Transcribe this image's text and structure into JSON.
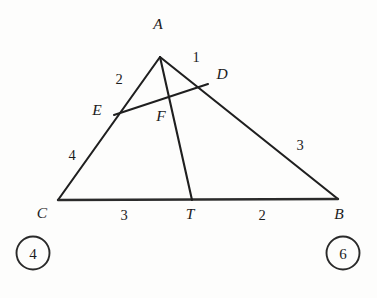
{
  "figure": {
    "background_color": "#fdfdfc",
    "stroke_color": "#1f1f1f",
    "text_color": "#1c1c1c"
  },
  "vertices": [
    {
      "id": "A",
      "label": "A",
      "x": 160,
      "y": 57,
      "label_x": 158,
      "label_y": 29
    },
    {
      "id": "B",
      "label": "B",
      "x": 338,
      "y": 199,
      "label_x": 339,
      "label_y": 219
    },
    {
      "id": "C",
      "label": "C",
      "x": 58,
      "y": 200,
      "label_x": 42,
      "label_y": 218
    },
    {
      "id": "D",
      "label": "D",
      "x": 208,
      "y": 84,
      "label_x": 222,
      "label_y": 79
    },
    {
      "id": "E",
      "label": "E",
      "x": 114,
      "y": 115,
      "label_x": 97,
      "label_y": 115
    },
    {
      "id": "F",
      "label": "F",
      "x": 170,
      "y": 97,
      "label_x": 161,
      "label_y": 121
    },
    {
      "id": "T",
      "label": "T",
      "x": 192,
      "y": 200,
      "label_x": 190,
      "label_y": 219
    }
  ],
  "segments": [
    {
      "id": "CA",
      "from": "C",
      "to": "A",
      "name": "side-c-to-a"
    },
    {
      "id": "AB",
      "from": "A",
      "to": "B",
      "name": "side-a-to-b"
    },
    {
      "id": "CB",
      "from": "C",
      "to": "B",
      "name": "base-c-to-b"
    },
    {
      "id": "AT",
      "from": "A",
      "to": "T",
      "name": "cevian-a-to-t"
    },
    {
      "id": "ED",
      "from": "E",
      "to": "D",
      "name": "transversal-e-to-d"
    }
  ],
  "segment_labels": [
    {
      "id": "AD",
      "value": "1",
      "x": 196,
      "y": 62,
      "name": "length-label-ad"
    },
    {
      "id": "AE",
      "value": "2",
      "x": 119,
      "y": 84,
      "name": "length-label-ae"
    },
    {
      "id": "EC",
      "value": "4",
      "x": 72,
      "y": 160,
      "name": "length-label-ec"
    },
    {
      "id": "DB",
      "value": "3",
      "x": 300,
      "y": 150,
      "name": "length-label-db"
    },
    {
      "id": "CT",
      "value": "3",
      "x": 124,
      "y": 220,
      "name": "length-label-ct"
    },
    {
      "id": "TB",
      "value": "2",
      "x": 262,
      "y": 220,
      "name": "length-label-tb"
    }
  ],
  "answer_circles": [
    {
      "id": "left",
      "value": "4",
      "cx": 33,
      "cy": 253,
      "r": 16.5,
      "name": "answer-circle-left"
    },
    {
      "id": "right",
      "value": "6",
      "cx": 343,
      "cy": 253,
      "r": 16.5,
      "name": "answer-circle-right"
    }
  ]
}
